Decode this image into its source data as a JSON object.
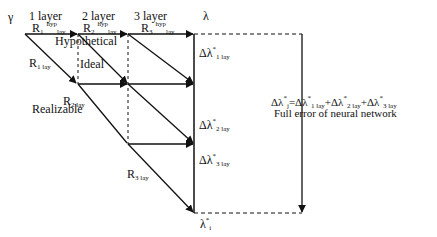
{
  "diagram": {
    "header": {
      "gamma": "γ",
      "layers": [
        "1 layer",
        "2 layer",
        "3 layer"
      ],
      "lambda": "λ"
    },
    "hyp_labels": [
      {
        "R": "R",
        "idx": "1",
        "sup": "hyp",
        "sub": "lay"
      },
      {
        "R": "R",
        "idx": "2",
        "sup": "hyp",
        "sub": "lay"
      },
      {
        "R": "R",
        "idx": "3",
        "sup": "hyp",
        "sub": "lay"
      }
    ],
    "region_labels": {
      "hypothetical": "Hypothetical",
      "ideal": "Ideal",
      "realizable": "Realizable"
    },
    "real_labels": [
      {
        "R": "R",
        "sub": "1 lay"
      },
      {
        "R": "R",
        "sub": "2 lay"
      },
      {
        "R": "R",
        "sub": "3 lay"
      }
    ],
    "delta_labels": [
      {
        "base": "Δλ",
        "sup": "*",
        "sub": "1 lay"
      },
      {
        "base": "Δλ",
        "sup": "*",
        "sub": "2 lay"
      },
      {
        "base": "Δλ",
        "sup": "*",
        "sub": "3 lay"
      }
    ],
    "result": {
      "base": "λ",
      "sup": "*",
      "sub": "i"
    },
    "full_error": {
      "lhs_base": "Δλ",
      "lhs_sup": "*",
      "lhs_sub": "j",
      "eq": "=",
      "terms": [
        {
          "base": "Δλ",
          "sup": "*",
          "sub": "1 lay"
        },
        {
          "base": "Δλ",
          "sup": "*",
          "sub": "2 lay"
        },
        {
          "base": "Δλ",
          "sup": "*",
          "sub": "3 lay"
        }
      ],
      "plus": "+",
      "caption": "Full error of neural network"
    },
    "colors": {
      "line": "#111111",
      "background": "#ffffff"
    }
  }
}
